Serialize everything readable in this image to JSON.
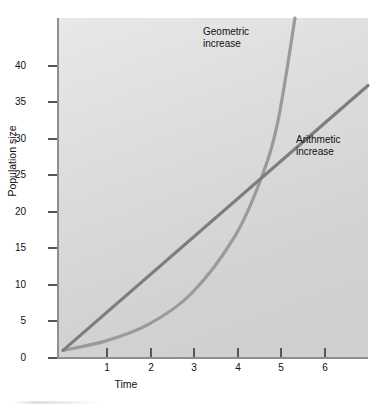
{
  "figure": {
    "background_color": "#ffffff",
    "plot_background_color": "#dcdcdc"
  },
  "axes": {
    "y_title": "Population size",
    "x_title": "Time",
    "y_ticks": [
      "0",
      "5",
      "10",
      "15",
      "20",
      "25",
      "30",
      "35",
      "40"
    ],
    "x_ticks": [
      "1",
      "2",
      "3",
      "4",
      "5",
      "6"
    ]
  },
  "annotations": {
    "geometric": "Geometric\nincrease",
    "arithmetic": "Arithmetic\nincrease"
  },
  "chart_data": {
    "type": "line",
    "title": "",
    "subtitle": "",
    "xlabel": "Time",
    "ylabel": "Population size",
    "xlim": [
      0,
      7.1
    ],
    "ylim": [
      0,
      46.3
    ],
    "x_ticks": [
      1,
      2,
      3,
      4,
      5,
      6
    ],
    "y_ticks": [
      0,
      5,
      10,
      15,
      20,
      25,
      30,
      35,
      40
    ],
    "grid": false,
    "legend": "inline-annotations",
    "annotations": [
      {
        "text": "Geometric increase",
        "x": 4.0,
        "y": 44.0
      },
      {
        "text": "Arithmetic increase",
        "x": 6.1,
        "y": 30.5
      }
    ],
    "series": [
      {
        "name": "Arithmetic increase",
        "color": "#7d7d7d",
        "shape": "straight-line",
        "x": [
          0,
          1,
          2,
          3,
          4,
          5,
          6,
          7.1
        ],
        "values": [
          0.5,
          5.65,
          10.8,
          15.95,
          21.1,
          26.25,
          31.4,
          37.0
        ]
      },
      {
        "name": "Geometric increase",
        "color": "#9a9a9a",
        "shape": "exponential-curve",
        "x": [
          0,
          1,
          2,
          3,
          4,
          4.6,
          5,
          5.4
        ],
        "values": [
          0.5,
          1.8,
          4.1,
          8.4,
          16.2,
          24.0,
          32.0,
          46.3
        ]
      }
    ],
    "intersection": {
      "x": 4.6,
      "y": 24.0
    }
  }
}
